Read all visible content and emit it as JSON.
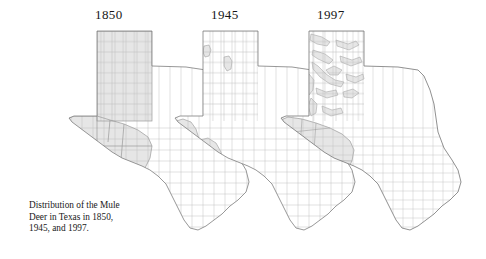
{
  "figure": {
    "title": "Distribution of the Mule Deer in Texas",
    "caption": "Distribution of the Mule\nDeer in Texas in 1850,\n1945, and 1997.",
    "background_color": "#ffffff"
  },
  "panels": [
    {
      "year": "1850",
      "label_x": 95,
      "region_note": "Panhandle and Trans-Pecos fully occupied"
    },
    {
      "year": "1945",
      "label_x": 211,
      "region_note": "Two small Panhandle patches; narrow Trans-Pecos band"
    },
    {
      "year": "1997",
      "label_x": 317,
      "region_note": "Fragmented Panhandle drainages; solid Trans-Pecos block"
    }
  ],
  "style": {
    "shade_fill": "#e6e6e6",
    "county_line": "#b4b4b4",
    "state_line": "#7d7d7d",
    "shade_line": "#9a9a9a",
    "text_color": "#161616"
  },
  "chart_data": {
    "type": "map",
    "title": "Distribution of the Mule Deer in Texas in 1850, 1945, and 1997.",
    "subtitle": "",
    "xlabel": "",
    "ylabel": "",
    "legend_position": "none",
    "grid": false,
    "categories": [
      "1850",
      "1945",
      "1997"
    ],
    "series": [
      {
        "name": "Occupied range (relative extent, normalized to 1850 = 100)",
        "values": [
          100,
          34,
          41
        ]
      },
      {
        "name": "Panhandle occupancy (relative extent)",
        "values": [
          100,
          8,
          22
        ]
      },
      {
        "name": "Trans-Pecos occupancy (relative extent)",
        "values": [
          100,
          55,
          72
        ]
      }
    ],
    "annotations": [
      "1850: continuous range across the entire Panhandle and the Trans-Pecos/Big Bend region",
      "1945: range collapsed to two isolated Panhandle patches and a narrow Trans-Pecos band",
      "1997: fragmented Panhandle patches along canyon and river drainages, plus a consolidated Trans-Pecos block"
    ]
  }
}
